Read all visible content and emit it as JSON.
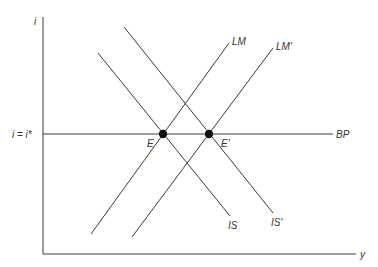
{
  "diagram": {
    "axes": {
      "y_label": "i",
      "x_label": "y",
      "y_tick_label": "i = i*"
    },
    "curves": [
      {
        "id": "BP",
        "label": "BP",
        "type": "horizontal"
      },
      {
        "id": "IS",
        "label": "IS",
        "type": "downward"
      },
      {
        "id": "IS_prime",
        "label": "IS'",
        "type": "downward"
      },
      {
        "id": "LM",
        "label": "LM",
        "type": "upward"
      },
      {
        "id": "LM_prime",
        "label": "LM'",
        "type": "upward"
      }
    ],
    "points": [
      {
        "id": "E",
        "label": "E"
      },
      {
        "id": "E_prime",
        "label": "E'"
      }
    ],
    "colors": {
      "line": "#3a3a3a",
      "point": "#111111"
    }
  }
}
